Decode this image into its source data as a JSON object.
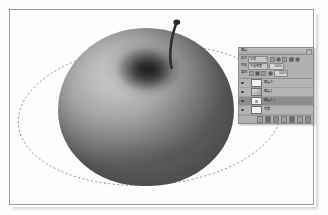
{
  "app": {
    "name": "Image Editor",
    "document_background": "#fefefe",
    "canvas_border_color": "#9a9a9a"
  },
  "canvas": {
    "name": "document-canvas",
    "artwork": {
      "subject": "apple",
      "render_style": "grayscale 3D shaded sphere with stem",
      "body_light": "#c8c8c8",
      "body_dark": "#5a5a5a",
      "stem_color": "#2f2f2f",
      "dimple_color": "#1a1a1a"
    },
    "path": {
      "name": "elliptical-selection-path",
      "style": "dashed",
      "stroke": "#8a8a8a",
      "anchor_points": 1
    }
  },
  "panel": {
    "title": "图层",
    "close_label": "×",
    "controls": {
      "blend_row": {
        "label": "模式",
        "value": "正常",
        "icons": [
          "lock-transparency-icon",
          "lock-image-icon",
          "lock-position-icon",
          "lock-all-icon",
          "menu-icon"
        ]
      },
      "opacity_row": {
        "label": "锁定",
        "field_label": "不透明度",
        "value": "100%",
        "unit": "%"
      },
      "fill_row": {
        "label": "填充",
        "value": "100%",
        "icons": [
          "transparency-icon",
          "brush-icon",
          "move-icon",
          "lock-icon"
        ]
      }
    },
    "layers": [
      {
        "name": "图层 3",
        "visible": true,
        "thumb": "white",
        "selected": false,
        "mark": ""
      },
      {
        "name": "图层 2",
        "visible": true,
        "thumb": "gray",
        "selected": false,
        "mark": ""
      },
      {
        "name": "图层 1",
        "visible": true,
        "thumb": "dot",
        "selected": true,
        "mark": "T"
      },
      {
        "name": "背景",
        "visible": true,
        "thumb": "white",
        "selected": false,
        "mark": ""
      }
    ],
    "footer_buttons": [
      "link-layers-icon",
      "layer-style-icon",
      "add-mask-icon",
      "new-group-icon",
      "adjustment-layer-icon",
      "new-layer-icon",
      "delete-layer-icon"
    ]
  }
}
